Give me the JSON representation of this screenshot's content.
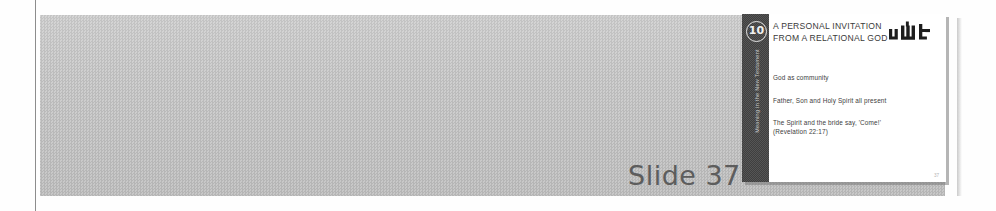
{
  "document": {
    "caption": {
      "label": "Slide",
      "number": "37"
    }
  },
  "slide": {
    "rail": {
      "badge_number": "10",
      "series_text": "Meaning in the New Testament"
    },
    "title_line_1": "A PERSONAL INVITATION",
    "title_line_2": "FROM A RELATIONAL GOD",
    "logo_name": "wlt-logo",
    "bullets": [
      {
        "text": "God as community",
        "reference": ""
      },
      {
        "text": "Father, Son and Holy Spirit all present",
        "reference": ""
      },
      {
        "text": "The Spirit and the bride say, 'Come!'",
        "reference": "(Revelation 22:17)"
      }
    ],
    "page_number": "37"
  },
  "colors": {
    "band_grey": "#c4c4c4",
    "rail_dark": "#4a4a4a",
    "caption_grey": "#5d5d5d",
    "slide_white": "#ffffff"
  }
}
